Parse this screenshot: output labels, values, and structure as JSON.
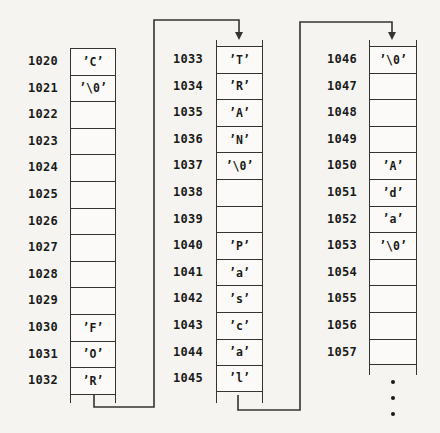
{
  "colors": {
    "background": "#f5f4f1",
    "cell_fill": "#fbfaf8",
    "line": "#333330",
    "text": "#1a1a18"
  },
  "columns": [
    {
      "id": "memory-column-1",
      "rows": [
        {
          "address": "1020",
          "value": "’C’"
        },
        {
          "address": "1021",
          "value": "’\\0’"
        },
        {
          "address": "1022",
          "value": ""
        },
        {
          "address": "1023",
          "value": ""
        },
        {
          "address": "1024",
          "value": ""
        },
        {
          "address": "1025",
          "value": ""
        },
        {
          "address": "1026",
          "value": ""
        },
        {
          "address": "1027",
          "value": ""
        },
        {
          "address": "1028",
          "value": ""
        },
        {
          "address": "1029",
          "value": ""
        },
        {
          "address": "1030",
          "value": "’F’"
        },
        {
          "address": "1031",
          "value": "’O’"
        },
        {
          "address": "1032",
          "value": "’R’"
        }
      ]
    },
    {
      "id": "memory-column-2",
      "rows": [
        {
          "address": "1033",
          "value": "’T’"
        },
        {
          "address": "1034",
          "value": "’R’"
        },
        {
          "address": "1035",
          "value": "’A’"
        },
        {
          "address": "1036",
          "value": "’N’"
        },
        {
          "address": "1037",
          "value": "’\\0’"
        },
        {
          "address": "1038",
          "value": ""
        },
        {
          "address": "1039",
          "value": ""
        },
        {
          "address": "1040",
          "value": "’P’"
        },
        {
          "address": "1041",
          "value": "’a’"
        },
        {
          "address": "1042",
          "value": "’s’"
        },
        {
          "address": "1043",
          "value": "’c’"
        },
        {
          "address": "1044",
          "value": "’a’"
        },
        {
          "address": "1045",
          "value": "’l’"
        }
      ]
    },
    {
      "id": "memory-column-3",
      "rows": [
        {
          "address": "1046",
          "value": "’\\0’"
        },
        {
          "address": "1047",
          "value": ""
        },
        {
          "address": "1048",
          "value": ""
        },
        {
          "address": "1049",
          "value": ""
        },
        {
          "address": "1050",
          "value": "’A’"
        },
        {
          "address": "1051",
          "value": "’d’"
        },
        {
          "address": "1052",
          "value": "’a’"
        },
        {
          "address": "1053",
          "value": "’\\0’"
        },
        {
          "address": "1054",
          "value": ""
        },
        {
          "address": "1055",
          "value": ""
        },
        {
          "address": "1056",
          "value": ""
        },
        {
          "address": "1057",
          "value": ""
        }
      ]
    }
  ],
  "connectors": [
    {
      "name": "col1-bottom-to-col2-top"
    },
    {
      "name": "col2-bottom-to-col3-top"
    }
  ],
  "ellipsis": {
    "dot_count": 3
  }
}
